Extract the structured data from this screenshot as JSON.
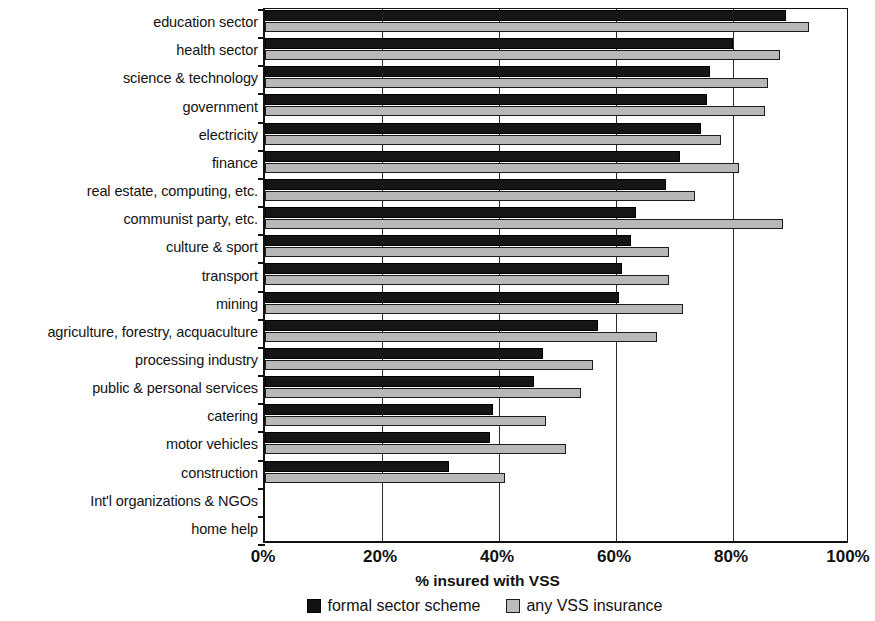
{
  "chart_data": {
    "type": "bar",
    "orientation": "horizontal",
    "title": "",
    "xlabel": "% insured with VSS",
    "ylabel": "",
    "xlim": [
      0,
      100
    ],
    "xticks": [
      "0%",
      "20%",
      "40%",
      "60%",
      "80%",
      "100%"
    ],
    "xtick_values": [
      0,
      20,
      40,
      60,
      80,
      100
    ],
    "grid": true,
    "legend_position": "bottom",
    "categories": [
      "education sector",
      "health sector",
      "science & technology",
      "government",
      "electricity",
      "finance",
      "real estate, computing, etc.",
      "communist party, etc.",
      "culture & sport",
      "transport",
      "mining",
      "agriculture, forestry, acquaculture",
      "processing industry",
      "public & personal services",
      "catering",
      "motor vehicles",
      "construction",
      "Int'l organizations & NGOs",
      "home help"
    ],
    "series": [
      {
        "name": "formal sector scheme",
        "color": "#151515",
        "values": [
          89,
          80,
          76,
          75.5,
          74.5,
          71,
          68.5,
          63.5,
          62.5,
          61,
          60.5,
          57,
          47.5,
          46,
          39,
          38.5,
          31.5,
          0,
          0
        ]
      },
      {
        "name": "any VSS insurance",
        "color": "#b8b8b8",
        "values": [
          93,
          88,
          86,
          85.5,
          78,
          81,
          73.5,
          88.5,
          69,
          69,
          71.5,
          67,
          56,
          54,
          48,
          51.5,
          41,
          0,
          0
        ]
      }
    ]
  },
  "legend": {
    "items": [
      {
        "label": "formal sector scheme",
        "swatch": "formal-swatch"
      },
      {
        "label": "any VSS insurance",
        "swatch": "any-swatch"
      }
    ]
  }
}
